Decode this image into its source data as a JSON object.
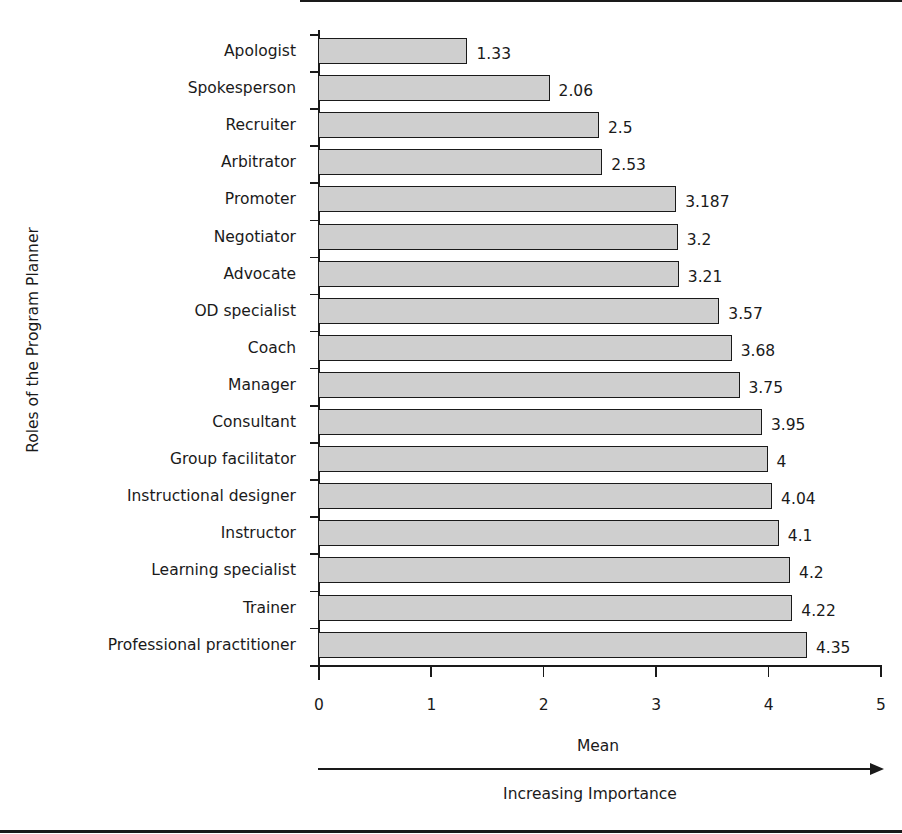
{
  "chart_data": {
    "type": "bar",
    "orientation": "horizontal",
    "title": "",
    "xlabel": "Mean",
    "xlabel_secondary": "Increasing Importance",
    "ylabel": "Roles of the Program Planner",
    "xlim": [
      0,
      5
    ],
    "xticks": [
      "0",
      "1",
      "2",
      "3",
      "4",
      "5"
    ],
    "grid": false,
    "legend": null,
    "categories": [
      "Apologist",
      "Spokesperson",
      "Recruiter",
      "Arbitrator",
      "Promoter",
      "Negotiator",
      "Advocate",
      "OD specialist",
      "Coach",
      "Manager",
      "Consultant",
      "Group facilitator",
      "Instructional designer",
      "Instructor",
      "Learning specialist",
      "Trainer",
      "Professional practitioner"
    ],
    "values": [
      1.33,
      2.06,
      2.5,
      2.53,
      3.187,
      3.2,
      3.21,
      3.57,
      3.68,
      3.75,
      3.95,
      4,
      4.04,
      4.1,
      4.2,
      4.22,
      4.35
    ],
    "value_labels": [
      "1.33",
      "2.06",
      "2.5",
      "2.53",
      "3.187",
      "3.2",
      "3.21",
      "3.57",
      "3.68",
      "3.75",
      "3.95",
      "4",
      "4.04",
      "4.1",
      "4.2",
      "4.22",
      "4.35"
    ],
    "bar_color": "#cfcfcf",
    "edge_color": "#1a1a1a"
  }
}
